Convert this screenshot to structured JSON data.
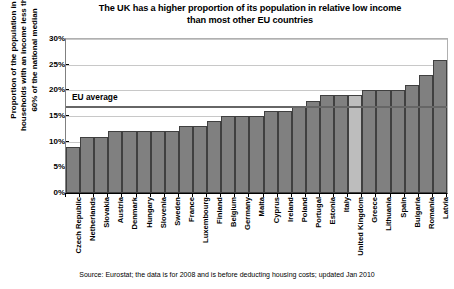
{
  "chart_data": {
    "type": "bar",
    "title": "The UK has a higher proportion of its population in relative low income than most other EU countries",
    "title_line1": "The UK has a higher proportion of its population in relative low income",
    "title_line2": "than most other EU countries",
    "xlabel": "",
    "ylabel": "Proportion of the population in households with an income less than 60% of the national median",
    "ylabel_line1": "Proportion of the population in",
    "ylabel_line2": "households with an income less than",
    "ylabel_line3": "60% of the national median",
    "ylim": [
      0,
      30
    ],
    "ytick_values": [
      0,
      5,
      10,
      15,
      20,
      25,
      30
    ],
    "ytick_labels": [
      "0%",
      "5%",
      "10%",
      "15%",
      "20%",
      "25%",
      "30%"
    ],
    "grid": true,
    "legend": "none",
    "categories": [
      "Czech Republic",
      "Netherlands",
      "Slovakia",
      "Austria",
      "Denmark",
      "Hungary",
      "Slovenia",
      "Sweden",
      "France",
      "Luxembourg",
      "Finland",
      "Belgium",
      "Germany",
      "Malta",
      "Cyprus",
      "Ireland",
      "Poland",
      "Portugal",
      "Estonia",
      "Italy",
      "United Kingdom",
      "Greece",
      "Lithuania",
      "Spain",
      "Bulgaria",
      "Romania",
      "Latvia"
    ],
    "values": [
      9,
      11,
      11,
      12,
      12,
      12,
      12,
      12,
      13,
      13,
      14,
      15,
      15,
      15,
      16,
      16,
      17,
      18,
      19,
      19,
      19,
      20,
      20,
      20,
      21,
      23,
      26
    ],
    "highlight_category": "United Kingdom",
    "highlight_index": 20,
    "annotations": [
      {
        "name": "eu-average",
        "label": "EU average",
        "value": 17
      }
    ],
    "source": "Source: Eurostat; the data is for 2008 and is before deducting housing costs; updated Jan 2010",
    "colors": {
      "bar": "#808080",
      "bar_border": "#404040",
      "bar_highlight": "#bdbdbd",
      "gridline": "#c8c8c8",
      "average_line": "#666666",
      "axis": "#000000",
      "text": "#000000",
      "background": "#ffffff"
    }
  }
}
